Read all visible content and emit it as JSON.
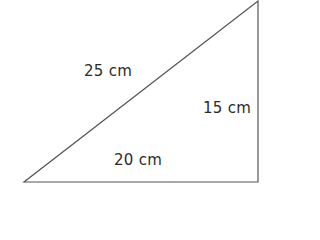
{
  "diagram": {
    "shape": "right-triangle",
    "stroke_color": "#555555",
    "text_color": "#2b2b2b",
    "vertices": {
      "bottom_left": [
        24,
        182
      ],
      "bottom_right": [
        258,
        182
      ],
      "top_right": [
        258,
        1
      ]
    },
    "labels": {
      "hypotenuse": "25 cm",
      "vertical_side": "15 cm",
      "base": "20 cm"
    }
  }
}
